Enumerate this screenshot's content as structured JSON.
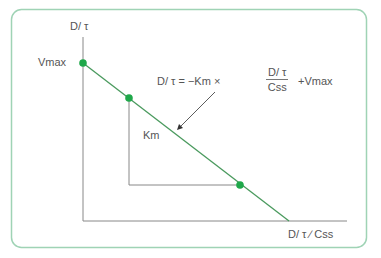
{
  "colors": {
    "frame": "#9fd3b5",
    "line": "#4a9a5e",
    "point": "#1fa84a",
    "axis": "#888888",
    "text": "#555555"
  },
  "axes": {
    "y_label": "D/ τ",
    "x_label": "D/ τ ∕ Css",
    "y_intercept_label": "Vmax"
  },
  "equation": {
    "lhs": "D/ τ = −Km ×",
    "fraction_numerator": "D/ τ",
    "fraction_denominator": "Css",
    "rhs": "+Vmax"
  },
  "slope_label": "Km",
  "points": [
    {
      "x": 83,
      "y": 63,
      "label": "Vmax"
    },
    {
      "x": 129,
      "y": 98
    },
    {
      "x": 240,
      "y": 185
    }
  ]
}
